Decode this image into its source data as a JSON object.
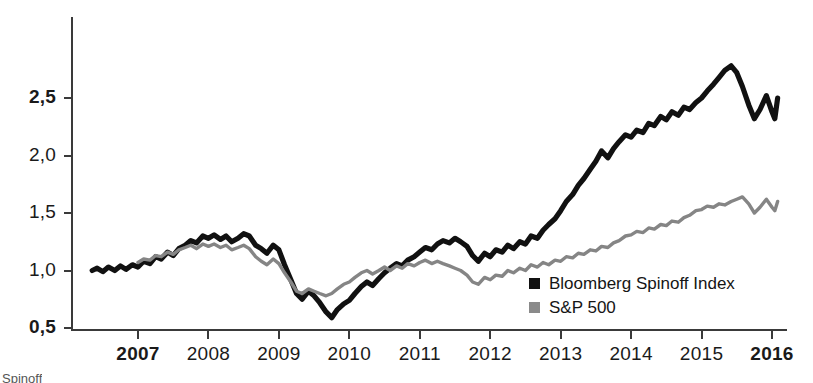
{
  "chart_data": {
    "type": "line",
    "title": "",
    "xlabel": "",
    "ylabel": "",
    "xlim": [
      2006.35,
      2016.1
    ],
    "ylim": [
      0.5,
      3.0
    ],
    "grid": false,
    "legend_position": "inside-bottom-right",
    "y_ticks": [
      "0,5",
      "1,0",
      "1,5",
      "2,0",
      "2,5"
    ],
    "y_tick_values": [
      0.5,
      1.0,
      1.5,
      2.0,
      2.5
    ],
    "y_ticks_bold": [
      "0,5",
      "2,5"
    ],
    "x_ticks": [
      "2007",
      "2008",
      "2009",
      "2010",
      "2011",
      "2012",
      "2013",
      "2014",
      "2015",
      "2016"
    ],
    "x_tick_values": [
      2007,
      2008,
      2009,
      2010,
      2011,
      2012,
      2013,
      2014,
      2015,
      2016
    ],
    "x_ticks_bold": [
      "2007",
      "2016"
    ],
    "series": [
      {
        "name": "Bloomberg Spinoff Index",
        "color": "#111111",
        "x": [
          2006.35,
          2006.42,
          2006.5,
          2006.58,
          2006.67,
          2006.75,
          2006.83,
          2006.92,
          2007.0,
          2007.08,
          2007.17,
          2007.25,
          2007.33,
          2007.42,
          2007.5,
          2007.58,
          2007.67,
          2007.75,
          2007.83,
          2007.92,
          2008.0,
          2008.08,
          2008.17,
          2008.25,
          2008.33,
          2008.42,
          2008.5,
          2008.58,
          2008.67,
          2008.75,
          2008.83,
          2008.92,
          2009.0,
          2009.08,
          2009.17,
          2009.25,
          2009.33,
          2009.42,
          2009.5,
          2009.58,
          2009.67,
          2009.75,
          2009.83,
          2009.92,
          2010.0,
          2010.08,
          2010.17,
          2010.25,
          2010.33,
          2010.42,
          2010.5,
          2010.58,
          2010.67,
          2010.75,
          2010.83,
          2010.92,
          2011.0,
          2011.08,
          2011.17,
          2011.25,
          2011.33,
          2011.42,
          2011.5,
          2011.58,
          2011.67,
          2011.75,
          2011.83,
          2011.92,
          2012.0,
          2012.08,
          2012.17,
          2012.25,
          2012.33,
          2012.42,
          2012.5,
          2012.58,
          2012.67,
          2012.75,
          2012.83,
          2012.92,
          2013.0,
          2013.08,
          2013.17,
          2013.25,
          2013.33,
          2013.42,
          2013.5,
          2013.58,
          2013.67,
          2013.75,
          2013.83,
          2013.92,
          2014.0,
          2014.08,
          2014.17,
          2014.25,
          2014.33,
          2014.42,
          2014.5,
          2014.58,
          2014.67,
          2014.75,
          2014.83,
          2014.92,
          2015.0,
          2015.08,
          2015.17,
          2015.25,
          2015.33,
          2015.42,
          2015.5,
          2015.58,
          2015.67,
          2015.75,
          2015.83,
          2015.92,
          2016.0,
          2016.04,
          2016.08
        ],
        "y": [
          1.0,
          1.02,
          0.99,
          1.03,
          1.0,
          1.04,
          1.01,
          1.05,
          1.03,
          1.08,
          1.06,
          1.12,
          1.1,
          1.16,
          1.13,
          1.19,
          1.22,
          1.26,
          1.24,
          1.3,
          1.28,
          1.31,
          1.27,
          1.3,
          1.25,
          1.28,
          1.32,
          1.3,
          1.22,
          1.19,
          1.15,
          1.22,
          1.18,
          1.05,
          0.92,
          0.8,
          0.75,
          0.82,
          0.78,
          0.72,
          0.64,
          0.59,
          0.66,
          0.71,
          0.74,
          0.8,
          0.86,
          0.9,
          0.87,
          0.93,
          0.98,
          1.02,
          1.06,
          1.04,
          1.09,
          1.12,
          1.16,
          1.2,
          1.18,
          1.23,
          1.26,
          1.24,
          1.28,
          1.25,
          1.21,
          1.13,
          1.08,
          1.15,
          1.12,
          1.18,
          1.16,
          1.22,
          1.19,
          1.25,
          1.23,
          1.3,
          1.28,
          1.35,
          1.4,
          1.45,
          1.52,
          1.6,
          1.66,
          1.74,
          1.8,
          1.88,
          1.95,
          2.04,
          1.98,
          2.06,
          2.12,
          2.18,
          2.16,
          2.22,
          2.2,
          2.28,
          2.26,
          2.34,
          2.31,
          2.38,
          2.35,
          2.42,
          2.4,
          2.46,
          2.5,
          2.56,
          2.62,
          2.68,
          2.74,
          2.78,
          2.72,
          2.6,
          2.44,
          2.32,
          2.4,
          2.52,
          2.38,
          2.32,
          2.5
        ]
      },
      {
        "name": "S&P 500",
        "color": "#858585",
        "x": [
          2007.0,
          2007.08,
          2007.17,
          2007.25,
          2007.33,
          2007.42,
          2007.5,
          2007.58,
          2007.67,
          2007.75,
          2007.83,
          2007.92,
          2008.0,
          2008.08,
          2008.17,
          2008.25,
          2008.33,
          2008.42,
          2008.5,
          2008.58,
          2008.67,
          2008.75,
          2008.83,
          2008.92,
          2009.0,
          2009.08,
          2009.17,
          2009.25,
          2009.33,
          2009.42,
          2009.5,
          2009.58,
          2009.67,
          2009.75,
          2009.83,
          2009.92,
          2010.0,
          2010.08,
          2010.17,
          2010.25,
          2010.33,
          2010.42,
          2010.5,
          2010.58,
          2010.67,
          2010.75,
          2010.83,
          2010.92,
          2011.0,
          2011.08,
          2011.17,
          2011.25,
          2011.33,
          2011.42,
          2011.5,
          2011.58,
          2011.67,
          2011.75,
          2011.83,
          2011.92,
          2012.0,
          2012.08,
          2012.17,
          2012.25,
          2012.33,
          2012.42,
          2012.5,
          2012.58,
          2012.67,
          2012.75,
          2012.83,
          2012.92,
          2013.0,
          2013.08,
          2013.17,
          2013.25,
          2013.33,
          2013.42,
          2013.5,
          2013.58,
          2013.67,
          2013.75,
          2013.83,
          2013.92,
          2014.0,
          2014.08,
          2014.17,
          2014.25,
          2014.33,
          2014.42,
          2014.5,
          2014.58,
          2014.67,
          2014.75,
          2014.83,
          2014.92,
          2015.0,
          2015.08,
          2015.17,
          2015.25,
          2015.33,
          2015.42,
          2015.5,
          2015.58,
          2015.67,
          2015.75,
          2015.83,
          2015.92,
          2016.0,
          2016.04,
          2016.08
        ],
        "y": [
          1.07,
          1.1,
          1.09,
          1.13,
          1.12,
          1.16,
          1.14,
          1.18,
          1.2,
          1.22,
          1.19,
          1.23,
          1.21,
          1.23,
          1.2,
          1.22,
          1.18,
          1.2,
          1.22,
          1.19,
          1.12,
          1.08,
          1.05,
          1.1,
          1.06,
          0.98,
          0.9,
          0.82,
          0.8,
          0.84,
          0.82,
          0.8,
          0.78,
          0.8,
          0.84,
          0.88,
          0.9,
          0.94,
          0.98,
          1.0,
          0.97,
          1.0,
          1.03,
          1.0,
          1.04,
          1.02,
          1.06,
          1.04,
          1.07,
          1.09,
          1.06,
          1.08,
          1.06,
          1.04,
          1.02,
          1.0,
          0.96,
          0.9,
          0.88,
          0.94,
          0.92,
          0.96,
          0.95,
          1.0,
          0.98,
          1.02,
          1.0,
          1.05,
          1.03,
          1.07,
          1.05,
          1.09,
          1.08,
          1.12,
          1.11,
          1.15,
          1.14,
          1.18,
          1.17,
          1.21,
          1.2,
          1.24,
          1.26,
          1.3,
          1.31,
          1.34,
          1.33,
          1.37,
          1.36,
          1.4,
          1.39,
          1.43,
          1.42,
          1.46,
          1.48,
          1.52,
          1.53,
          1.56,
          1.55,
          1.58,
          1.57,
          1.6,
          1.62,
          1.64,
          1.58,
          1.5,
          1.55,
          1.62,
          1.55,
          1.52,
          1.6
        ]
      }
    ]
  },
  "legend": {
    "items": [
      {
        "label": "Bloomberg Spinoff Index",
        "color": "#111111"
      },
      {
        "label": "S&P 500",
        "color": "#8a8a8a"
      }
    ]
  },
  "footnote": {
    "text": "Spinoff"
  }
}
